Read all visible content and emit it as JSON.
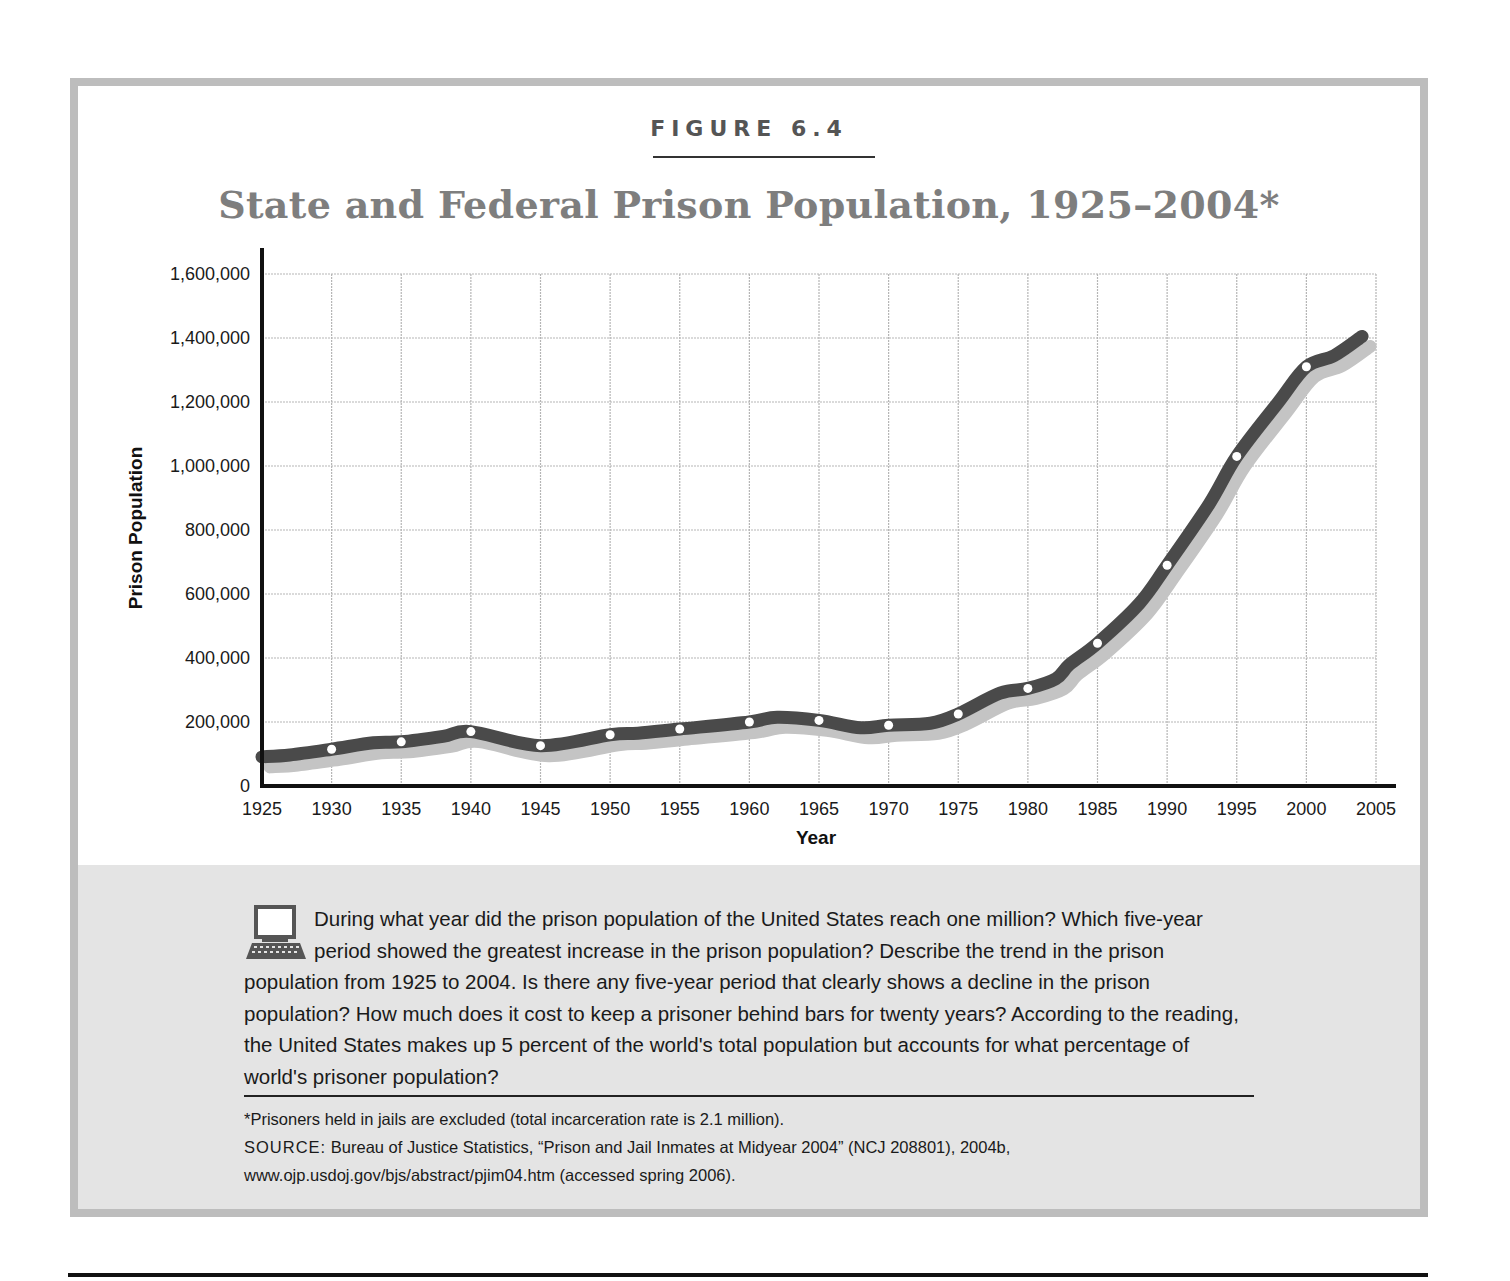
{
  "figure": {
    "label": "FIGURE 6.4",
    "title": "State and Federal Prison Population, 1925–2004*"
  },
  "colors": {
    "line": "#4a4a4a",
    "shadow": "#c4c4c4",
    "grid": "#b5b5b5",
    "title": "#7e7e7e",
    "panel": "#e4e4e4",
    "frame": "#bdbdbd"
  },
  "chart_data": {
    "type": "line",
    "title": "State and Federal Prison Population, 1925–2004*",
    "xlabel": "Year",
    "ylabel": "Prison Population",
    "xlim": [
      1925,
      2005
    ],
    "ylim": [
      0,
      1600000
    ],
    "grid": true,
    "legend": null,
    "x_ticks": [
      "1925",
      "1930",
      "1935",
      "1940",
      "1945",
      "1950",
      "1955",
      "1960",
      "1965",
      "1970",
      "1975",
      "1980",
      "1985",
      "1990",
      "1995",
      "2000",
      "2005"
    ],
    "y_ticks": [
      "0",
      "200,000",
      "400,000",
      "600,000",
      "800,000",
      "1,000,000",
      "1,200,000",
      "1,400,000",
      "1,600,000"
    ],
    "y_tick_values": [
      0,
      200000,
      400000,
      600000,
      800000,
      1000000,
      1200000,
      1400000,
      1600000
    ],
    "series": [
      {
        "name": "State and Federal Prison Population",
        "x": [
          1925,
          1927,
          1930,
          1933,
          1935,
          1938,
          1940,
          1945,
          1950,
          1952,
          1955,
          1960,
          1962,
          1965,
          1968,
          1970,
          1973,
          1975,
          1978,
          1980,
          1982,
          1983,
          1985,
          1988,
          1990,
          1993,
          1995,
          1998,
          2000,
          2002,
          2004
        ],
        "values": [
          91000,
          97000,
          115000,
          135000,
          138000,
          155000,
          170000,
          126000,
          160000,
          165000,
          178000,
          200000,
          215000,
          205000,
          182000,
          190000,
          196000,
          225000,
          290000,
          305000,
          335000,
          380000,
          446000,
          570000,
          690000,
          880000,
          1030000,
          1200000,
          1310000,
          1345000,
          1405000
        ]
      }
    ],
    "markers": {
      "x": [
        1930,
        1935,
        1940,
        1945,
        1950,
        1955,
        1960,
        1965,
        1970,
        1975,
        1980,
        1985,
        1990,
        1995,
        2000
      ],
      "values": [
        115000,
        138000,
        170000,
        126000,
        160000,
        178000,
        200000,
        205000,
        190000,
        225000,
        305000,
        446000,
        690000,
        1030000,
        1310000
      ]
    },
    "annotations": []
  },
  "panel": {
    "question": "During what year did the prison population of the United States reach one million? Which five-year period showed the greatest increase in the prison population? Describe the trend in the prison population from 1925 to 2004. Is there any five-year period that clearly shows a decline in the prison population? How much does it cost to keep a prisoner behind bars for twenty years? According to the reading, the United States makes up 5 percent of the world's total population but accounts for what percentage of world's prisoner population?",
    "footnote": "*Prisoners held in jails are excluded (total incarceration rate is 2.1 million).",
    "source_label": "SOURCE:",
    "source_text": "Bureau of Justice Statistics, “Prison and Jail Inmates at Midyear 2004” (NCJ 208801), 2004b, www.ojp.usdoj.gov/bjs/abstract/pjim04.htm (accessed spring 2006).",
    "icon": "computer-icon"
  }
}
